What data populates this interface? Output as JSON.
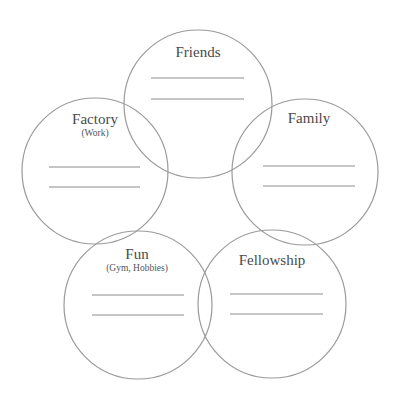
{
  "diagram": {
    "colors": {
      "stroke": "#9a9a9a",
      "line": "#8c8c8c",
      "text": "#4a4a4a"
    },
    "circles": [
      {
        "id": "friends",
        "title": "Friends",
        "subtitle": "",
        "cx": 198,
        "cy": 104,
        "r": 74,
        "title_y": 57,
        "sub_y": 0,
        "lines_y": [
          78,
          99
        ],
        "line_x1": 151,
        "line_x2": 244
      },
      {
        "id": "factory",
        "title": "Factory",
        "subtitle": "(Work)",
        "cx": 95,
        "cy": 171,
        "r": 73,
        "title_y": 124,
        "sub_y": 136,
        "lines_y": [
          167,
          187
        ],
        "line_x1": 49,
        "line_x2": 140
      },
      {
        "id": "family",
        "title": "Family",
        "subtitle": "",
        "cx": 305,
        "cy": 172,
        "r": 73,
        "title_y": 123,
        "sub_y": 0,
        "lines_y": [
          166,
          186
        ],
        "line_x1": 263,
        "line_x2": 355
      },
      {
        "id": "fun",
        "title": "Fun",
        "subtitle": "(Gym, Hobbies)",
        "cx": 138,
        "cy": 305,
        "r": 74,
        "title_y": 259,
        "sub_y": 271,
        "lines_y": [
          295,
          315
        ],
        "line_x1": 92,
        "line_x2": 184
      },
      {
        "id": "fellowship",
        "title": "Fellowship",
        "subtitle": "",
        "cx": 272,
        "cy": 304,
        "r": 74,
        "title_y": 265,
        "sub_y": 0,
        "lines_y": [
          294,
          314
        ],
        "line_x1": 230,
        "line_x2": 323
      }
    ]
  }
}
